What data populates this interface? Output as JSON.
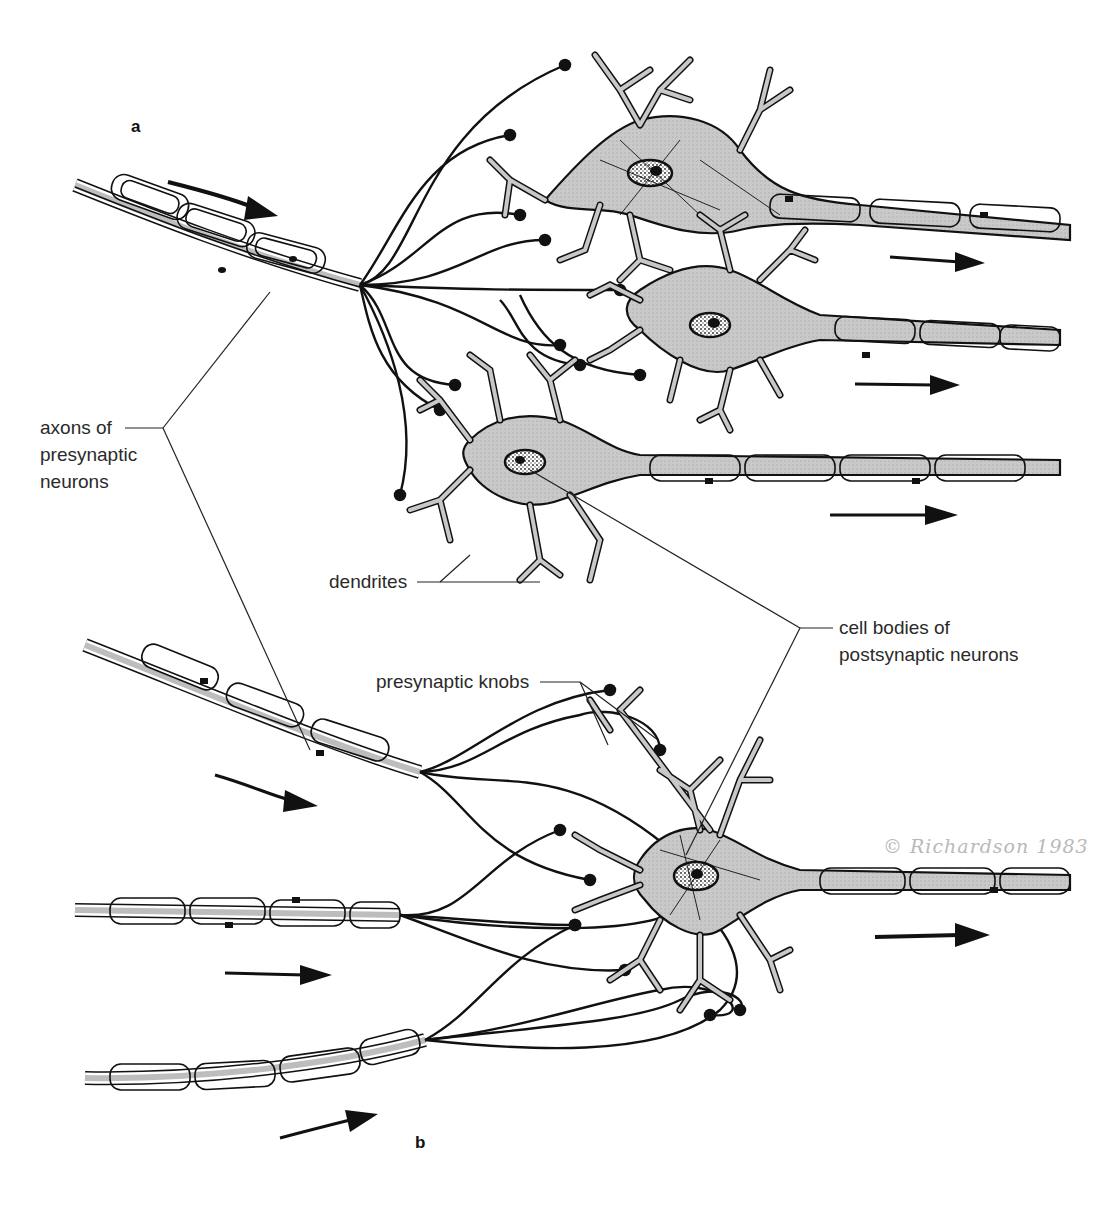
{
  "figure": {
    "panels": [
      {
        "id": "a",
        "label": "a"
      },
      {
        "id": "b",
        "label": "b"
      }
    ],
    "labels": {
      "axons": "axons of\npresynaptic\nneurons",
      "dendrites": "dendrites",
      "cell_bodies": "cell bodies of\npostsynaptic neurons",
      "presynaptic_knobs": "presynaptic knobs"
    },
    "signature": "© Richardson 1983",
    "colors": {
      "ink": "#111111",
      "cytoplasm": "#c8c8c8",
      "axon_core": "#bdbdbd",
      "label_text": "#2a2a2a",
      "signature": "#b9b9b9",
      "background": "#ffffff"
    }
  }
}
